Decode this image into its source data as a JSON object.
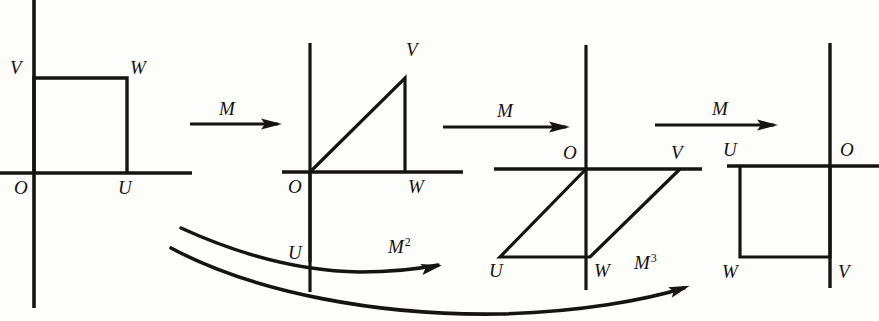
{
  "figure": {
    "background_color": "#fdfdfb",
    "ink_color": "#161412",
    "width": 879,
    "height": 321
  },
  "panels": [
    {
      "id": "panel-1",
      "name": "original-square",
      "origin": {
        "x": 34,
        "y": 173
      },
      "vertex_labels": [
        {
          "key": "O",
          "text": "O",
          "x": 14,
          "y": 178
        },
        {
          "key": "U",
          "text": "U",
          "x": 118,
          "y": 178
        },
        {
          "key": "V",
          "text": "V",
          "x": 10,
          "y": 58
        },
        {
          "key": "W",
          "text": "W",
          "x": 130,
          "y": 58
        }
      ],
      "shape": "square",
      "shape_points": "34,173 34,78 127,78 127,173",
      "x_axis": {
        "x1": 0,
        "y1": 173,
        "x2": 192,
        "y2": 173
      },
      "y_axis": {
        "x1": 34,
        "y1": 0,
        "x2": 34,
        "y2": 308
      }
    },
    {
      "id": "panel-2",
      "name": "first-image",
      "origin": {
        "x": 310,
        "y": 172
      },
      "vertex_labels": [
        {
          "key": "O",
          "text": "O",
          "x": 288,
          "y": 177
        },
        {
          "key": "U",
          "text": "U",
          "x": 288,
          "y": 243
        },
        {
          "key": "V",
          "text": "V",
          "x": 406,
          "y": 40
        },
        {
          "key": "W",
          "text": "W",
          "x": 408,
          "y": 177
        }
      ],
      "shape": "parallelogram",
      "shape_points": "310,262 310,172 405,78 405,172",
      "x_axis": {
        "x1": 282,
        "y1": 172,
        "x2": 463,
        "y2": 172
      },
      "y_axis": {
        "x1": 310,
        "y1": 43,
        "x2": 310,
        "y2": 292
      }
    },
    {
      "id": "panel-3",
      "name": "second-image",
      "origin": {
        "x": 586,
        "y": 169
      },
      "vertex_labels": [
        {
          "key": "O",
          "text": "O",
          "x": 563,
          "y": 143
        },
        {
          "key": "U",
          "text": "U",
          "x": 489,
          "y": 261
        },
        {
          "key": "V",
          "text": "V",
          "x": 671,
          "y": 143
        },
        {
          "key": "W",
          "text": "W",
          "x": 594,
          "y": 261
        }
      ],
      "shape": "parallelogram",
      "shape_points": "586,169 500,257 590,257 680,169",
      "x_axis": {
        "x1": 494,
        "y1": 169,
        "x2": 702,
        "y2": 169
      },
      "y_axis": {
        "x1": 586,
        "y1": 45,
        "x2": 586,
        "y2": 290
      }
    },
    {
      "id": "panel-4",
      "name": "third-image",
      "origin": {
        "x": 830,
        "y": 166
      },
      "vertex_labels": [
        {
          "key": "U",
          "text": "U",
          "x": 723,
          "y": 140
        },
        {
          "key": "O",
          "text": "O",
          "x": 840,
          "y": 140
        },
        {
          "key": "W",
          "text": "W",
          "x": 722,
          "y": 262
        },
        {
          "key": "V",
          "text": "V",
          "x": 838,
          "y": 262
        }
      ],
      "shape": "square",
      "shape_points": "740,166 740,257 830,257 830,166",
      "x_axis": {
        "x1": 727,
        "y1": 166,
        "x2": 879,
        "y2": 166
      },
      "y_axis": {
        "x1": 830,
        "y1": 43,
        "x2": 830,
        "y2": 288
      }
    }
  ],
  "straight_arrows": [
    {
      "id": "arrow-m-1",
      "label": "M",
      "exponent": "",
      "label_x": 219,
      "label_y": 98,
      "shaft": {
        "x1": 190,
        "y1": 124,
        "x2": 278,
        "y2": 124
      },
      "head": {
        "x": 278,
        "y": 124
      }
    },
    {
      "id": "arrow-m-2",
      "label": "M",
      "exponent": "",
      "label_x": 497,
      "label_y": 100,
      "shaft": {
        "x1": 443,
        "y1": 127,
        "x2": 566,
        "y2": 127
      },
      "head": {
        "x": 566,
        "y": 127
      }
    },
    {
      "id": "arrow-m-3",
      "label": "M",
      "exponent": "",
      "label_x": 712,
      "label_y": 98,
      "shaft": {
        "x1": 655,
        "y1": 125,
        "x2": 774,
        "y2": 125
      },
      "head": {
        "x": 774,
        "y": 125
      }
    }
  ],
  "curved_arrows": [
    {
      "id": "arrow-m-squared",
      "label": "M",
      "exponent": "2",
      "label_x": 388,
      "label_y": 236,
      "path": "M 181,228 C 240,255 300,271 360,272 C 390,272 418,269 438,265",
      "head": {
        "x": 438,
        "y": 266,
        "angle": -12
      }
    },
    {
      "id": "arrow-m-cubed",
      "label": "M",
      "exponent": "3",
      "label_x": 634,
      "label_y": 252,
      "path": "M 171,248 C 255,293 380,316 500,314 C 580,312 645,300 684,288",
      "head": {
        "x": 686,
        "y": 287,
        "angle": -19
      }
    }
  ]
}
